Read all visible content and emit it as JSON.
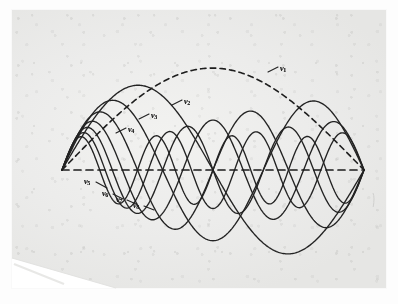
{
  "figure": {
    "kind": "scanned-diagram",
    "axis_label": "",
    "colors": {
      "ink": "#232323",
      "paper": "#ececeb",
      "page_background": "#fdfdfd"
    }
  },
  "axis": {
    "name": "equilibrium-axis",
    "style": "dashed",
    "x_start": 50,
    "x_end": 352,
    "y": 160
  },
  "modes": [
    {
      "id": "n1",
      "label": "ν",
      "subscript": "1",
      "harmonic": 1,
      "half_waves": 1,
      "amplitude": 98,
      "style": "dashed",
      "label_x": 268,
      "label_y": 55,
      "leader": {
        "x1": 256,
        "y1": 62,
        "x2": 266,
        "y2": 57
      }
    },
    {
      "id": "n2",
      "label": "ν",
      "subscript": "2",
      "harmonic": 2,
      "half_waves": 2,
      "amplitude": 82,
      "style": "solid",
      "label_x": 172,
      "label_y": 88,
      "leader": {
        "x1": 160,
        "y1": 95,
        "x2": 170,
        "y2": 90
      }
    },
    {
      "id": "n3",
      "label": "ν",
      "subscript": "3",
      "harmonic": 3,
      "half_waves": 3,
      "amplitude": 68,
      "style": "solid",
      "label_x": 139,
      "label_y": 102,
      "leader": {
        "x1": 127,
        "y1": 109,
        "x2": 137,
        "y2": 104
      }
    },
    {
      "id": "n4",
      "label": "ν",
      "subscript": "4",
      "harmonic": 4,
      "half_waves": 4,
      "amplitude": 57,
      "style": "solid",
      "label_x": 116,
      "label_y": 116,
      "leader": {
        "x1": 104,
        "y1": 123,
        "x2": 114,
        "y2": 118
      }
    },
    {
      "id": "n5",
      "label": "ν",
      "subscript": "5",
      "harmonic": 5,
      "half_waves": 5,
      "amplitude": 48,
      "style": "solid",
      "label_x": 72,
      "label_y": 168,
      "leader": {
        "x1": 84,
        "y1": 172,
        "x2": 95,
        "y2": 178
      }
    },
    {
      "id": "n6",
      "label": "ν",
      "subscript": "6",
      "harmonic": 6,
      "half_waves": 6,
      "amplitude": 42,
      "style": "solid",
      "label_x": 90,
      "label_y": 180,
      "leader": {
        "x1": 101,
        "y1": 184,
        "x2": 111,
        "y2": 189
      }
    },
    {
      "id": "n7",
      "label": "ν",
      "subscript": "7",
      "harmonic": 7,
      "half_waves": 7,
      "amplitude": 37,
      "style": "solid",
      "label_x": 104,
      "label_y": 186,
      "leader": {
        "x1": 115,
        "y1": 190,
        "x2": 124,
        "y2": 194
      }
    },
    {
      "id": "n8",
      "label": "ν",
      "subscript": "8",
      "harmonic": 8,
      "half_waves": 8,
      "amplitude": 33,
      "style": "solid",
      "label_x": 121,
      "label_y": 192,
      "leader": {
        "x1": 132,
        "y1": 196,
        "x2": 142,
        "y2": 200
      }
    }
  ]
}
